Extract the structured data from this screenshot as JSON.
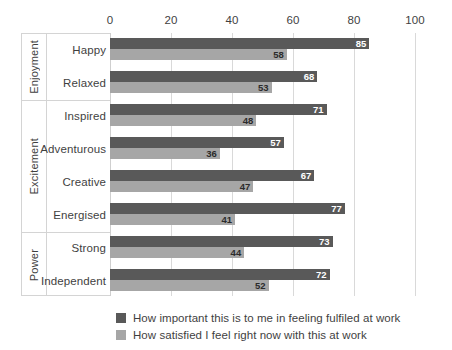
{
  "chart_data": {
    "type": "bar",
    "orientation": "horizontal",
    "title": "",
    "xlabel": "",
    "ylabel": "",
    "xlim": [
      0,
      100
    ],
    "ticks": [
      "0",
      "20",
      "40",
      "60",
      "80",
      "100"
    ],
    "tick_values": [
      0,
      20,
      40,
      60,
      80,
      100
    ],
    "grid": "vertical",
    "legend_position": "bottom",
    "categories": [
      "Happy",
      "Relaxed",
      "Inspired",
      "Adventurous",
      "Creative",
      "Energised",
      "Strong",
      "Independent"
    ],
    "groups": [
      {
        "name": "Enjoyment",
        "categories": [
          "Happy",
          "Relaxed"
        ]
      },
      {
        "name": "Excitement",
        "categories": [
          "Inspired",
          "Adventurous",
          "Creative",
          "Energised"
        ]
      },
      {
        "name": "Power",
        "categories": [
          "Strong",
          "Independent"
        ]
      }
    ],
    "series": [
      {
        "name": "How important this is to me in feeling fulfiled at work",
        "color": "#595959",
        "values": [
          85,
          68,
          71,
          57,
          67,
          77,
          73,
          72
        ]
      },
      {
        "name": "How satisfied I feel right now with this at work",
        "color": "#a6a6a6",
        "values": [
          58,
          53,
          48,
          36,
          47,
          41,
          44,
          52
        ]
      }
    ]
  },
  "legend": {
    "items": [
      {
        "label": "How important this is to me in feeling fulfiled at work",
        "color": "#595959"
      },
      {
        "label": "How satisfied I feel right now with this at work",
        "color": "#a6a6a6"
      }
    ]
  },
  "colors": {
    "series_important": "#595959",
    "series_satisfied": "#a6a6a6",
    "gridline": "#d9d9d9",
    "panel_border": "#d4d4d4",
    "text": "#3f3f3f",
    "background": "#ffffff"
  }
}
